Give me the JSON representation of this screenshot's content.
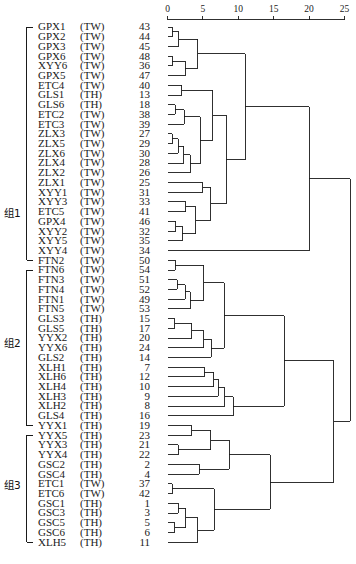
{
  "figure": {
    "type": "dendrogram",
    "orientation": "horizontal",
    "linkage_note": "rescaled distance cluster combine"
  },
  "axis": {
    "ticks": [
      0,
      5,
      10,
      15,
      20,
      25
    ],
    "tick_labels": [
      "0",
      "5",
      "10",
      "15",
      "20",
      "25"
    ],
    "range": [
      0,
      25
    ],
    "position": "top"
  },
  "groups": [
    {
      "id": "g1",
      "label": "组1",
      "first_leaf": 0,
      "last_leaf": 24
    },
    {
      "id": "g2",
      "label": "组2",
      "first_leaf": 25,
      "last_leaf": 41
    },
    {
      "id": "g3",
      "label": "组3",
      "first_leaf": 42,
      "last_leaf": 53
    }
  ],
  "columns": {
    "name": "Sample",
    "population": "Population",
    "num": "Num"
  },
  "leaves": [
    {
      "name": "GPX1",
      "pop": "(TW)",
      "num": "43"
    },
    {
      "name": "GPX2",
      "pop": "(TW)",
      "num": "44"
    },
    {
      "name": "GPX3",
      "pop": "(TW)",
      "num": "45"
    },
    {
      "name": "GPX6",
      "pop": "(TW)",
      "num": "48"
    },
    {
      "name": "XYY6",
      "pop": "(TW)",
      "num": "36"
    },
    {
      "name": "GPX5",
      "pop": "(TW)",
      "num": "47"
    },
    {
      "name": "ETC4",
      "pop": "(TW)",
      "num": "40"
    },
    {
      "name": "GLS1",
      "pop": "(TH)",
      "num": "13"
    },
    {
      "name": "GLS6",
      "pop": "(TH)",
      "num": "18"
    },
    {
      "name": "ETC2",
      "pop": "(TW)",
      "num": "38"
    },
    {
      "name": "ETC3",
      "pop": "(TW)",
      "num": "39"
    },
    {
      "name": "ZLX3",
      "pop": "(TW)",
      "num": "27"
    },
    {
      "name": "ZLX5",
      "pop": "(TW)",
      "num": "29"
    },
    {
      "name": "ZLX6",
      "pop": "(TW)",
      "num": "30"
    },
    {
      "name": "ZLX4",
      "pop": "(TW)",
      "num": "28"
    },
    {
      "name": "ZLX2",
      "pop": "(TW)",
      "num": "26"
    },
    {
      "name": "ZLX1",
      "pop": "(TW)",
      "num": "25"
    },
    {
      "name": "XYY1",
      "pop": "(TW)",
      "num": "31"
    },
    {
      "name": "XYY3",
      "pop": "(TW)",
      "num": "33"
    },
    {
      "name": "ETC5",
      "pop": "(TW)",
      "num": "41"
    },
    {
      "name": "GPX4",
      "pop": "(TW)",
      "num": "46"
    },
    {
      "name": "XYY2",
      "pop": "(TW)",
      "num": "32"
    },
    {
      "name": "XYY5",
      "pop": "(TW)",
      "num": "35"
    },
    {
      "name": "XYY4",
      "pop": "(TW)",
      "num": "34"
    },
    {
      "name": "FTN2",
      "pop": "(TW)",
      "num": "50"
    },
    {
      "name": "FTN6",
      "pop": "(TW)",
      "num": "54"
    },
    {
      "name": "FTN3",
      "pop": "(TW)",
      "num": "51"
    },
    {
      "name": "FTN4",
      "pop": "(TW)",
      "num": "52"
    },
    {
      "name": "FTN1",
      "pop": "(TW)",
      "num": "49"
    },
    {
      "name": "FTN5",
      "pop": "(TW)",
      "num": "53"
    },
    {
      "name": "GLS3",
      "pop": "(TH)",
      "num": "15"
    },
    {
      "name": "GLS5",
      "pop": "(TH)",
      "num": "17"
    },
    {
      "name": "YYX2",
      "pop": "(TH)",
      "num": "20"
    },
    {
      "name": "YYX6",
      "pop": "(TH)",
      "num": "24"
    },
    {
      "name": "GLS2",
      "pop": "(TH)",
      "num": "14"
    },
    {
      "name": "XLH1",
      "pop": "(TH)",
      "num": "7"
    },
    {
      "name": "XLH6",
      "pop": "(TH)",
      "num": "12"
    },
    {
      "name": "XLH4",
      "pop": "(TH)",
      "num": "10"
    },
    {
      "name": "XLH3",
      "pop": "(TH)",
      "num": "9"
    },
    {
      "name": "XLH2",
      "pop": "(TH)",
      "num": "8"
    },
    {
      "name": "GLS4",
      "pop": "(TH)",
      "num": "16"
    },
    {
      "name": "YYX1",
      "pop": "(TH)",
      "num": "19"
    },
    {
      "name": "YYX5",
      "pop": "(TH)",
      "num": "23"
    },
    {
      "name": "YYX3",
      "pop": "(TH)",
      "num": "21"
    },
    {
      "name": "YYX4",
      "pop": "(TH)",
      "num": "22"
    },
    {
      "name": "GSC2",
      "pop": "(TH)",
      "num": "2"
    },
    {
      "name": "GSC4",
      "pop": "(TH)",
      "num": "4"
    },
    {
      "name": "ETC1",
      "pop": "(TW)",
      "num": "37"
    },
    {
      "name": "ETC6",
      "pop": "(TW)",
      "num": "42"
    },
    {
      "name": "GSC1",
      "pop": "(TH)",
      "num": "1"
    },
    {
      "name": "GSC3",
      "pop": "(TH)",
      "num": "3"
    },
    {
      "name": "GSC5",
      "pop": "(TH)",
      "num": "5"
    },
    {
      "name": "GSC6",
      "pop": "(TH)",
      "num": "6"
    },
    {
      "name": "XLH5",
      "pop": "(TH)",
      "num": "11"
    }
  ],
  "chart_data": {
    "type": "dendrogram",
    "title": "",
    "xlabel": "",
    "ylabel": "",
    "xlim": [
      0,
      25
    ],
    "grid": false,
    "legend": "none",
    "leaf_order": [
      "GPX1",
      "GPX2",
      "GPX3",
      "GPX6",
      "XYY6",
      "GPX5",
      "ETC4",
      "GLS1",
      "GLS6",
      "ETC2",
      "ETC3",
      "ZLX3",
      "ZLX5",
      "ZLX6",
      "ZLX4",
      "ZLX2",
      "ZLX1",
      "XYY1",
      "XYY3",
      "ETC5",
      "GPX4",
      "XYY2",
      "XYY5",
      "XYY4",
      "FTN2",
      "FTN6",
      "FTN3",
      "FTN4",
      "FTN1",
      "FTN5",
      "GLS3",
      "GLS5",
      "YYX2",
      "YYX6",
      "GLS2",
      "XLH1",
      "XLH6",
      "XLH4",
      "XLH3",
      "XLH2",
      "GLS4",
      "YYX1",
      "YYX5",
      "YYX3",
      "YYX4",
      "GSC2",
      "GSC4",
      "ETC1",
      "ETC6",
      "GSC1",
      "GSC3",
      "GSC5",
      "GSC6",
      "XLH5"
    ],
    "merges": [
      {
        "id": "m1",
        "a": "GPX1",
        "b": "GPX2",
        "dist": 0.7
      },
      {
        "id": "m2",
        "a": "m1",
        "b": "GPX3",
        "dist": 1.6
      },
      {
        "id": "m3",
        "a": "GPX6",
        "b": "XYY6",
        "dist": 0.7
      },
      {
        "id": "m4",
        "a": "m3",
        "b": "GPX5",
        "dist": 2.5
      },
      {
        "id": "m5",
        "a": "m2",
        "b": "m4",
        "dist": 4.3
      },
      {
        "id": "m6",
        "a": "ETC4",
        "b": "GLS1",
        "dist": 2.0
      },
      {
        "id": "m7",
        "a": "GLS6",
        "b": "ETC2",
        "dist": 1.1
      },
      {
        "id": "m8",
        "a": "m7",
        "b": "ETC3",
        "dist": 2.4
      },
      {
        "id": "m9",
        "a": "ZLX3",
        "b": "ZLX5",
        "dist": 0.7
      },
      {
        "id": "m10",
        "a": "m9",
        "b": "ZLX6",
        "dist": 1.5
      },
      {
        "id": "m11",
        "a": "m10",
        "b": "ZLX4",
        "dist": 2.3
      },
      {
        "id": "m12",
        "a": "m11",
        "b": "ZLX2",
        "dist": 3.2
      },
      {
        "id": "m13",
        "a": "m8",
        "b": "m12",
        "dist": 4.6
      },
      {
        "id": "m14",
        "a": "m6",
        "b": "m13",
        "dist": 6.4
      },
      {
        "id": "m15",
        "a": "ZLX1",
        "b": "XYY1",
        "dist": 5.0
      },
      {
        "id": "m16",
        "a": "XYY3",
        "b": "ETC5",
        "dist": 2.6
      },
      {
        "id": "m17",
        "a": "GPX4",
        "b": "XYY2",
        "dist": 1.2
      },
      {
        "id": "m18",
        "a": "m17",
        "b": "XYY5",
        "dist": 2.1
      },
      {
        "id": "m19",
        "a": "m16",
        "b": "m18",
        "dist": 4.0
      },
      {
        "id": "m20",
        "a": "m15",
        "b": "m19",
        "dist": 6.1
      },
      {
        "id": "m21",
        "a": "m14",
        "b": "m20",
        "dist": 8.3
      },
      {
        "id": "m22",
        "a": "m5",
        "b": "m21",
        "dist": 11.0
      },
      {
        "id": "m23",
        "a": "m22",
        "b": "XYY4",
        "dist": 20.0
      },
      {
        "id": "m24",
        "a": "FTN2",
        "b": "FTN6",
        "dist": 1.1
      },
      {
        "id": "m25",
        "a": "FTN3",
        "b": "FTN4",
        "dist": 1.4
      },
      {
        "id": "m26",
        "a": "m25",
        "b": "FTN1",
        "dist": 2.5
      },
      {
        "id": "m27",
        "a": "m26",
        "b": "FTN5",
        "dist": 3.2
      },
      {
        "id": "m28",
        "a": "m24",
        "b": "m27",
        "dist": 5.1
      },
      {
        "id": "m29",
        "a": "GLS3",
        "b": "GLS5",
        "dist": 1.0
      },
      {
        "id": "m30",
        "a": "m29",
        "b": "YYX2",
        "dist": 3.4
      },
      {
        "id": "m31",
        "a": "m30",
        "b": "YYX6",
        "dist": 5.1
      },
      {
        "id": "m32",
        "a": "m31",
        "b": "GLS2",
        "dist": 6.2
      },
      {
        "id": "m33",
        "a": "m28",
        "b": "m32",
        "dist": 8.0
      },
      {
        "id": "m34",
        "a": "XLH1",
        "b": "XLH6",
        "dist": 5.2
      },
      {
        "id": "m35",
        "a": "m34",
        "b": "XLH4",
        "dist": 6.5
      },
      {
        "id": "m36",
        "a": "m35",
        "b": "XLH3",
        "dist": 7.2
      },
      {
        "id": "m37",
        "a": "m36",
        "b": "XLH2",
        "dist": 8.1
      },
      {
        "id": "m38",
        "a": "m37",
        "b": "GLS4",
        "dist": 9.3
      },
      {
        "id": "m39",
        "a": "m33",
        "b": "m38",
        "dist": 16.5
      },
      {
        "id": "m40",
        "a": "YYX1",
        "b": "YYX5",
        "dist": 3.4
      },
      {
        "id": "m41",
        "a": "YYX3",
        "b": "YYX4",
        "dist": 1.5
      },
      {
        "id": "m42",
        "a": "m40",
        "b": "m41",
        "dist": 6.1
      },
      {
        "id": "m43",
        "a": "GSC2",
        "b": "GSC4",
        "dist": 4.5
      },
      {
        "id": "m44",
        "a": "m42",
        "b": "m43",
        "dist": 8.7
      },
      {
        "id": "m45",
        "a": "ETC1",
        "b": "ETC6",
        "dist": 0.7
      },
      {
        "id": "m46",
        "a": "GSC1",
        "b": "GSC3",
        "dist": 1.5
      },
      {
        "id": "m47",
        "a": "GSC5",
        "b": "GSC6",
        "dist": 1.0
      },
      {
        "id": "m48",
        "a": "m46",
        "b": "m47",
        "dist": 2.6
      },
      {
        "id": "m49",
        "a": "m48",
        "b": "XLH5",
        "dist": 4.3
      },
      {
        "id": "m50",
        "a": "m45",
        "b": "m49",
        "dist": 6.6
      },
      {
        "id": "m51",
        "a": "m44",
        "b": "m50",
        "dist": 14.5
      },
      {
        "id": "m52",
        "a": "m39",
        "b": "m51",
        "dist": 23.5
      },
      {
        "id": "m53",
        "a": "m23",
        "b": "m52",
        "dist": 25.8
      }
    ]
  }
}
